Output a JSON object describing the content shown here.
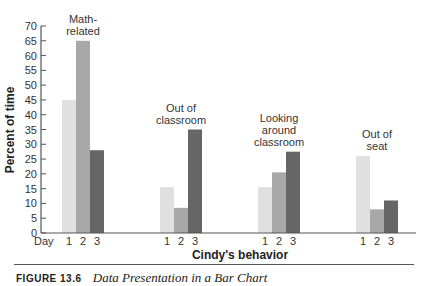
{
  "chart_data": {
    "type": "bar",
    "title": "",
    "xlabel": "Cindy's behavior",
    "ylabel": "Percent of time",
    "ylim": [
      0,
      70
    ],
    "yticks": [
      0,
      5,
      10,
      15,
      20,
      25,
      30,
      35,
      40,
      45,
      50,
      55,
      60,
      65,
      70
    ],
    "grid": false,
    "legend": null,
    "x_prefix_label": "Day",
    "categories": [
      "Math-related",
      "Out of classroom",
      "Looking around classroom",
      "Out of seat"
    ],
    "category_label_lines": [
      [
        "Math-",
        "related"
      ],
      [
        "Out of",
        "classroom"
      ],
      [
        "Looking",
        "around",
        "classroom"
      ],
      [
        "Out of",
        "seat"
      ]
    ],
    "series": [
      {
        "name": "1",
        "color": "#e0e0e0",
        "values": [
          45,
          15.5,
          15.5,
          26
        ]
      },
      {
        "name": "2",
        "color": "#a8a8a8",
        "values": [
          65,
          8.5,
          20.5,
          8
        ]
      },
      {
        "name": "3",
        "color": "#666666",
        "values": [
          28,
          35,
          27.5,
          11
        ]
      }
    ]
  },
  "caption": {
    "figure_label": "FIGURE 13.6",
    "title": "Data Presentation in a Bar Chart"
  }
}
